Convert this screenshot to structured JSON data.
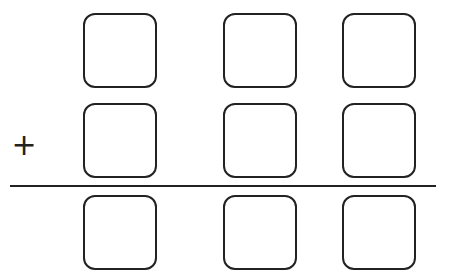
{
  "problem": {
    "type": "column-addition",
    "operator": "+",
    "rows": [
      {
        "name": "addend-1",
        "cells": [
          "",
          "",
          ""
        ]
      },
      {
        "name": "addend-2",
        "cells": [
          "",
          "",
          ""
        ]
      },
      {
        "name": "sum",
        "cells": [
          "",
          "",
          ""
        ]
      }
    ],
    "colors": {
      "stroke": "#222222",
      "background": "#ffffff"
    }
  }
}
